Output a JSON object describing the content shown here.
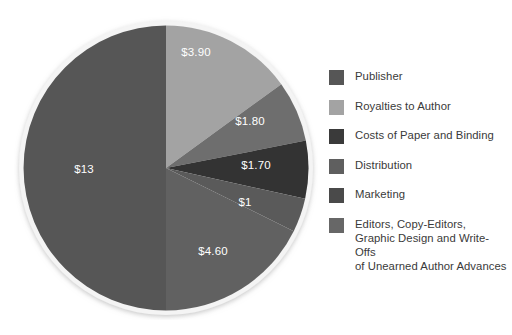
{
  "chart_data": {
    "type": "pie",
    "title": "",
    "subtitle": "",
    "xlabel": "",
    "ylabel": "",
    "currency": "$",
    "total": 26.0,
    "units": "US dollars per book",
    "start_angle_deg": 0,
    "direction": "clockwise",
    "legend_position": "right",
    "grid": false,
    "categories": [
      "Publisher",
      "Royalties to Author",
      "Costs of Paper and Binding",
      "Distribution",
      "Marketing",
      "Editors, Copy-Editors,\nGraphic Design and Write-Offs\nof Unearned Author Advances"
    ],
    "values": [
      13,
      3.9,
      1.8,
      1.7,
      1.0,
      4.6
    ],
    "data_labels": [
      "$13",
      "$3.90",
      "$1.80",
      "$1.70",
      "$1",
      "$4.60"
    ],
    "colors": [
      "#565656",
      "#a3a3a3",
      "#6e6e6e",
      "#333333",
      "#5a5a5a",
      "#616161"
    ],
    "slices": [
      {
        "label": "Royalties to Author",
        "data_label": "$3.90",
        "value": 3.9,
        "color": "#a3a3a3",
        "start_deg": 0,
        "sweep_deg": 54.0,
        "label_x": 196,
        "label_y": 53
      },
      {
        "label": "Costs of Paper and Binding",
        "data_label": "$1.80",
        "value": 1.8,
        "color": "#6e6e6e",
        "start_deg": 54.0,
        "sweep_deg": 24.92,
        "label_x": 250,
        "label_y": 122
      },
      {
        "label": "Distribution",
        "data_label": "$1.70",
        "value": 1.7,
        "color": "#333333",
        "start_deg": 78.92,
        "sweep_deg": 23.54,
        "label_x": 256,
        "label_y": 166
      },
      {
        "label": "Marketing",
        "data_label": "$1",
        "value": 1.0,
        "color": "#5a5a5a",
        "start_deg": 102.46,
        "sweep_deg": 13.85,
        "label_x": 245,
        "label_y": 203
      },
      {
        "label": "Editors, Copy-Editors, Graphic Design and Write-Offs of Unearned Author Advances",
        "data_label": "$4.60",
        "value": 4.6,
        "color": "#616161",
        "start_deg": 116.31,
        "sweep_deg": 63.69,
        "label_x": 213,
        "label_y": 252
      },
      {
        "label": "Publisher",
        "data_label": "$13",
        "value": 13,
        "color": "#565656",
        "start_deg": 180.0,
        "sweep_deg": 180.0,
        "label_x": 84,
        "label_y": 170
      }
    ]
  },
  "legend": {
    "items": [
      {
        "label": "Publisher",
        "color": "#565656"
      },
      {
        "label": "Royalties to Author",
        "color": "#a3a3a3"
      },
      {
        "label": "Costs of Paper and Binding",
        "color": "#3a3a3a"
      },
      {
        "label": "Distribution",
        "color": "#5f5f5f"
      },
      {
        "label": "Marketing",
        "color": "#4a4a4a"
      },
      {
        "label": "Editors, Copy-Editors,\nGraphic Design and Write-Offs\nof Unearned Author Advances",
        "color": "#676767"
      }
    ]
  },
  "style": {
    "background": "#ffffff",
    "label_text_color": "#ffffff",
    "legend_text_color": "#3a3a3a",
    "pie_rim_color": "#f2f2f2"
  }
}
